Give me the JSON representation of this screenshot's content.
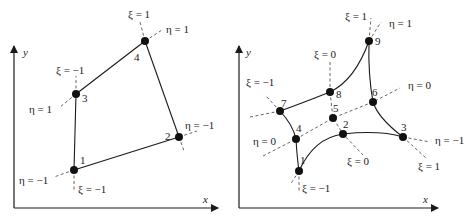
{
  "colors": {
    "ink": "#1a1a1a",
    "dash": "#555555",
    "background": "#ffffff"
  },
  "left_diagram": {
    "title": "4-node quadrilateral element",
    "axes": {
      "x_label": "x",
      "y_label": "y"
    },
    "nodes": [
      {
        "id": "1",
        "x": 74,
        "y": 170
      },
      {
        "id": "2",
        "x": 179,
        "y": 137
      },
      {
        "id": "3",
        "x": 76,
        "y": 94
      },
      {
        "id": "4",
        "x": 145,
        "y": 41
      }
    ],
    "coord_labels": {
      "xi_pos_top": "ξ = 1",
      "eta_pos_top": "η = 1",
      "xi_neg_node3": "ξ = −1",
      "eta_pos_node3": "η = 1",
      "eta_neg_node2": "η = −1",
      "eta_neg_node1": "η = −1",
      "xi_neg_node1": "ξ = −1"
    }
  },
  "right_diagram": {
    "title": "9-node quadrilateral element",
    "axes": {
      "x_label": "x",
      "y_label": "y"
    },
    "nodes": [
      {
        "id": "1",
        "x": 299,
        "y": 171
      },
      {
        "id": "2",
        "x": 343,
        "y": 134
      },
      {
        "id": "3",
        "x": 403,
        "y": 137
      },
      {
        "id": "4",
        "x": 296,
        "y": 139
      },
      {
        "id": "5",
        "x": 333,
        "y": 118
      },
      {
        "id": "6",
        "x": 373,
        "y": 102
      },
      {
        "id": "7",
        "x": 280,
        "y": 111
      },
      {
        "id": "8",
        "x": 330,
        "y": 92
      },
      {
        "id": "9",
        "x": 369,
        "y": 41
      }
    ],
    "coord_labels": {
      "xi_pos_top": "ξ = 1",
      "eta_pos_top": "η = 1",
      "xi_zero_top": "ξ = 0",
      "xi_neg_left": "ξ = −1",
      "eta_zero_right": "η = 0",
      "eta_zero_left": "η = 0",
      "eta_neg_right": "η = −1",
      "xi_zero_bottom": "ξ = 0",
      "xi_pos_bottom": "ξ = 1",
      "xi_neg_bottom": "ξ = −1"
    }
  }
}
